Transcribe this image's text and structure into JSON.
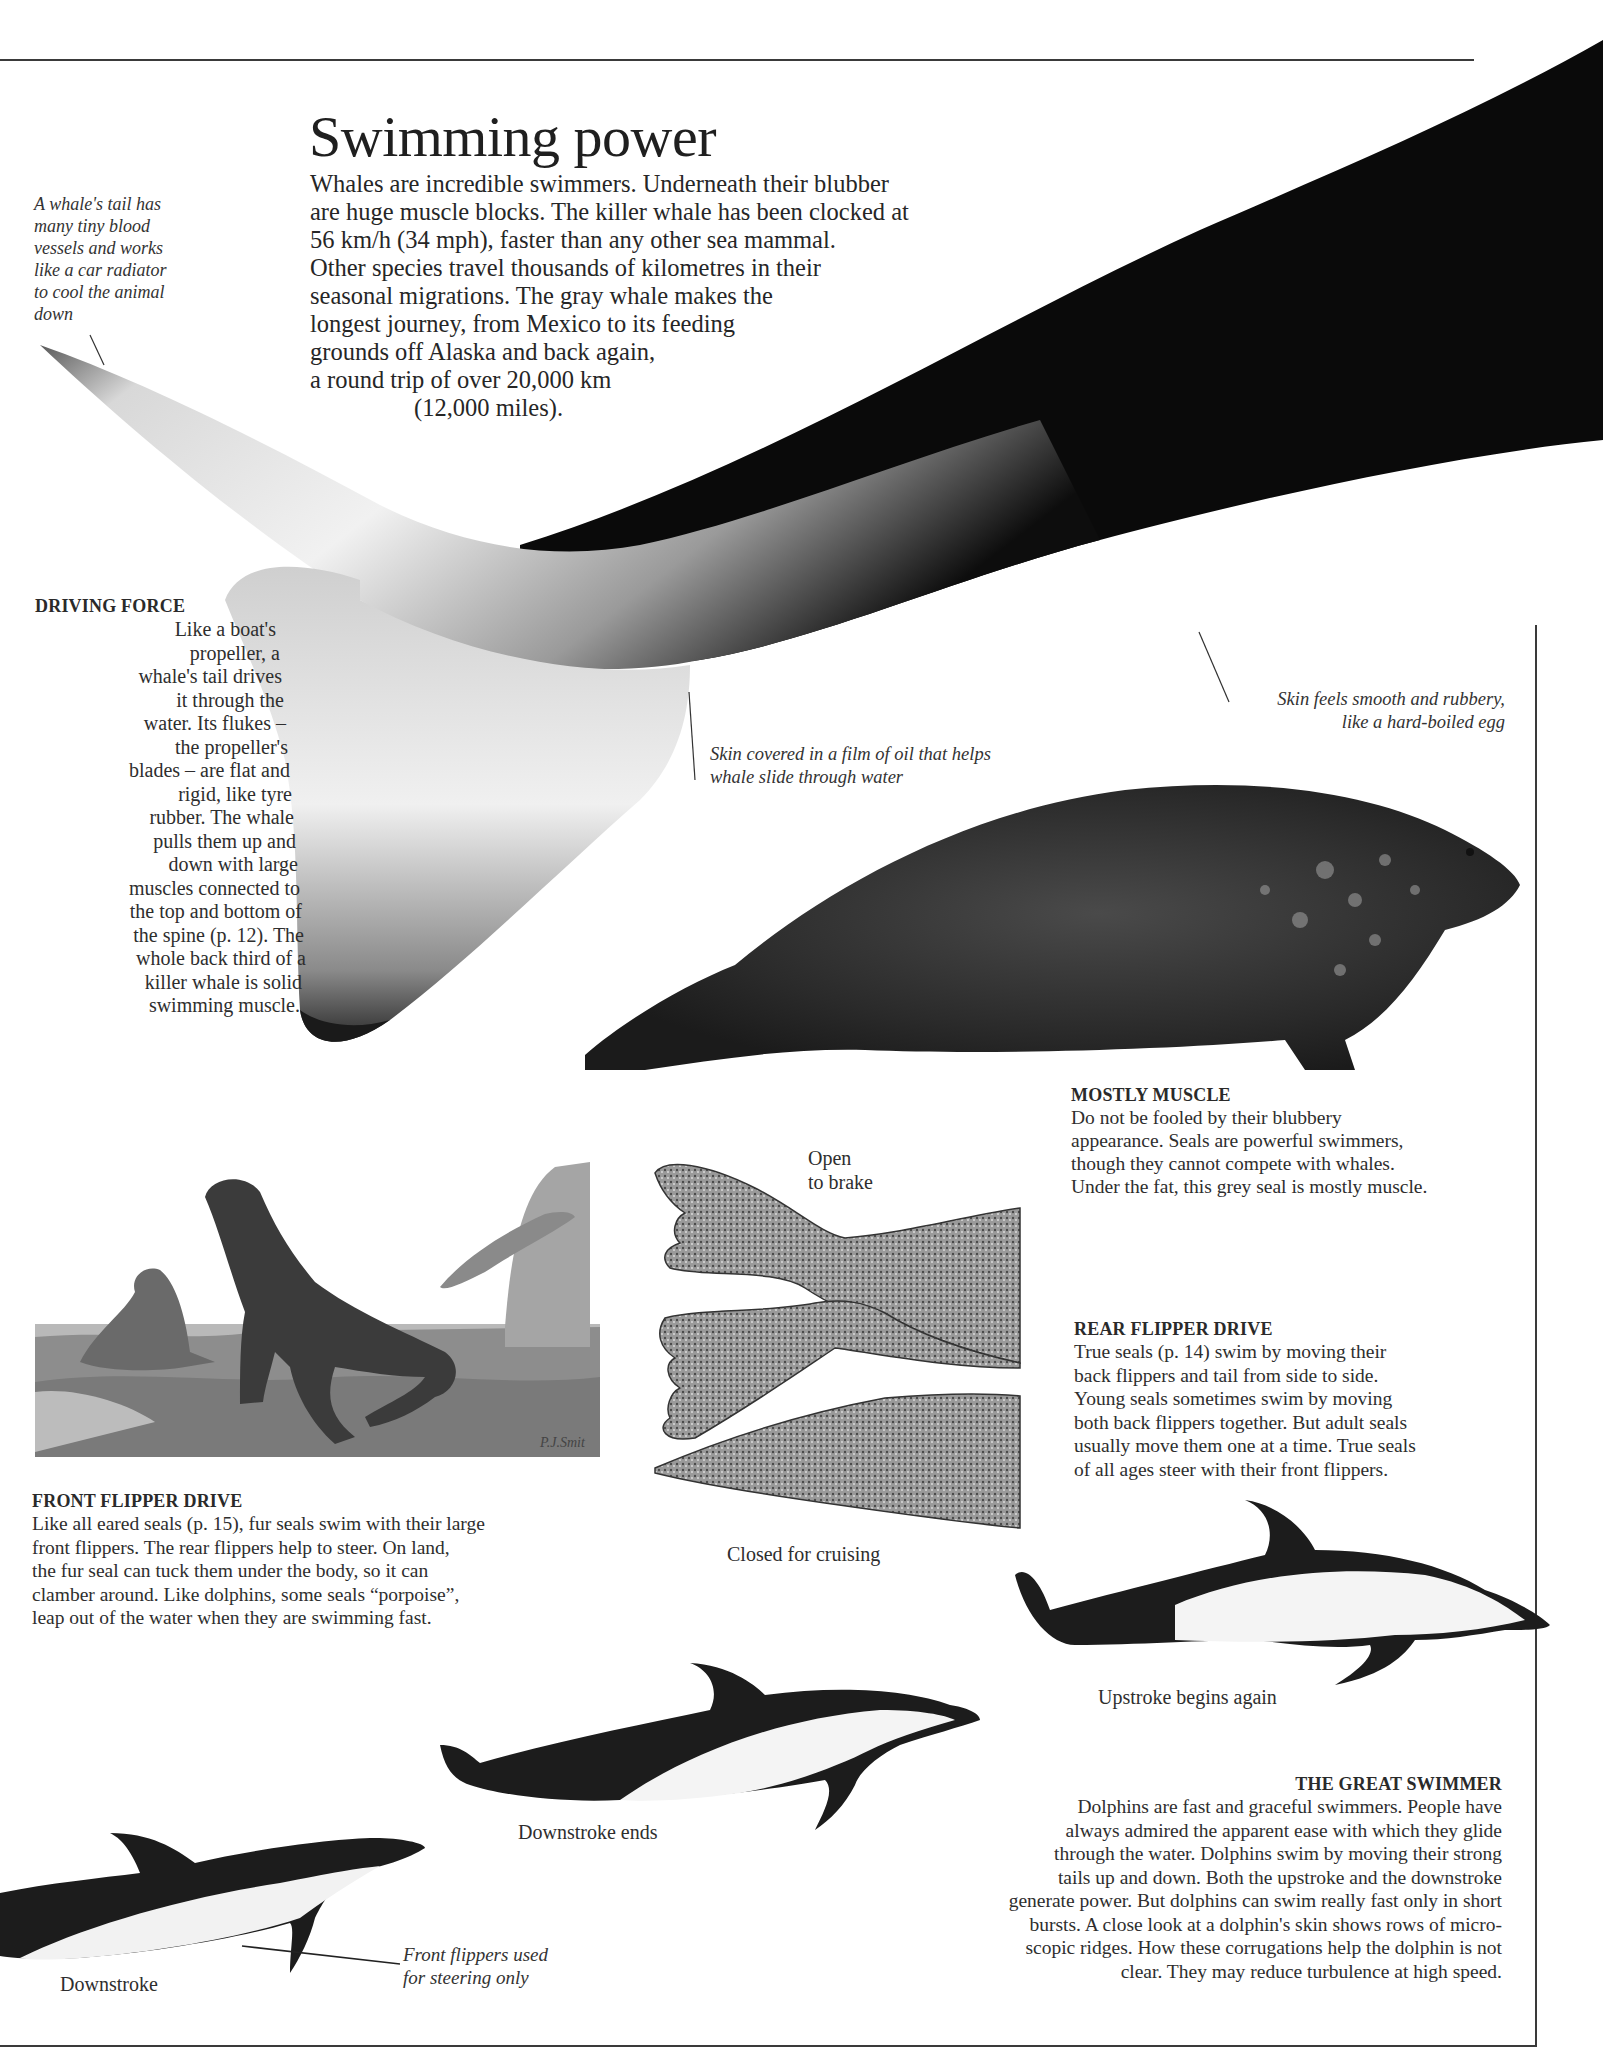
{
  "page": {
    "title": "Swimming power",
    "intro_lines": [
      "Whales are incredible swimmers. Underneath their blubber",
      "are huge muscle blocks. The killer whale has been clocked at",
      "56 km/h (34 mph), faster than any other sea mammal.",
      "Other species travel thousands of kilometres in their",
      "seasonal migrations. The gray whale makes the",
      "longest journey, from Mexico to its feeding",
      "grounds off Alaska and back again,",
      "a round trip of over 20,000 km",
      "(12,000 miles)."
    ]
  },
  "captions": {
    "whale_tail_cooling": [
      "A whale's tail has",
      "many tiny blood",
      "vessels and works",
      "like a car radiator",
      "to cool the animal",
      "down"
    ],
    "skin_smooth": [
      "Skin feels smooth and rubbery,",
      "like a hard-boiled egg"
    ],
    "skin_oil": [
      "Skin covered in a film of oil that helps",
      "whale slide through water"
    ],
    "front_flippers_steering": [
      "Front flippers used",
      "for steering only"
    ]
  },
  "sections": {
    "driving_force": {
      "heading": "DRIVING FORCE",
      "lines": [
        "Like a boat's",
        "propeller, a",
        "whale's tail drives",
        "it through the",
        "water. Its flukes –",
        "the propeller's",
        "blades – are flat and",
        "rigid, like tyre",
        "rubber. The whale",
        "pulls them up and",
        "down with large",
        "muscles connected to",
        "the top and bottom of",
        "the spine (p. 12). The",
        "whole back third of a",
        "killer whale is solid",
        "swimming muscle."
      ]
    },
    "mostly_muscle": {
      "heading": "MOSTLY MUSCLE",
      "lines": [
        "Do not be fooled by their blubbery",
        "appearance. Seals are powerful swimmers,",
        "though they cannot compete with whales.",
        "Under the fat, this grey seal is mostly muscle."
      ]
    },
    "rear_flipper_drive": {
      "heading": "REAR FLIPPER DRIVE",
      "lines": [
        "True seals (p. 14) swim by moving their",
        "back flippers and tail from side to side.",
        "Young seals sometimes swim by moving",
        "both back flippers together. But adult seals",
        "usually move them one at a time. True seals",
        "of all ages steer with their front flippers."
      ]
    },
    "front_flipper_drive": {
      "heading": "FRONT FLIPPER DRIVE",
      "lines": [
        "Like all eared seals (p. 15), fur seals swim with their large",
        "front flippers. The rear flippers help to steer. On land,",
        "the fur seal can tuck them under the body, so it can",
        "clamber around. Like dolphins, some seals “porpoise”,",
        "leap out of the water when they are swimming fast."
      ]
    },
    "great_swimmer": {
      "heading": "THE GREAT SWIMMER",
      "lines": [
        "Dolphins are fast and graceful swimmers. People have",
        "always admired the apparent ease with which they glide",
        "through the water. Dolphins swim by moving their strong",
        "tails up and down. Both the upstroke and the downstroke",
        "generate power. But dolphins can swim really fast only in short",
        "bursts. A close look at a dolphin's skin shows rows of micro-",
        "scopic ridges. How these corrugations help the dolphin is not",
        "clear. They may reduce turbulence at high speed."
      ]
    }
  },
  "figure_labels": {
    "flipper_open": [
      "Open",
      "to brake"
    ],
    "flipper_closed": "Closed for cruising",
    "upstroke": "Upstroke begins again",
    "downstroke_ends": "Downstroke ends",
    "downstroke": "Downstroke",
    "painting_signature": "P.J.Smit"
  },
  "colors": {
    "ink": "#2a2a2a",
    "whale_black": "#0b0b0b",
    "rule": "#3a3a3a",
    "paper": "#ffffff"
  }
}
